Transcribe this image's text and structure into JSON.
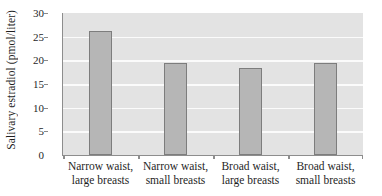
{
  "chart_data": {
    "type": "bar",
    "title": "",
    "xlabel": "",
    "ylabel": "Salivary estradiol (pmol/liter)",
    "categories": [
      "Narrow waist, large breasts",
      "Narrow waist, small breasts",
      "Broad waist, large breasts",
      "Broad waist, small breasts"
    ],
    "category_lines": [
      [
        "Narrow waist,",
        "large breasts"
      ],
      [
        "Narrow waist,",
        "small breasts"
      ],
      [
        "Broad waist,",
        "large breasts"
      ],
      [
        "Broad waist,",
        "small breasts"
      ]
    ],
    "values": [
      26.2,
      19.5,
      18.4,
      19.4
    ],
    "ylim": [
      0,
      30
    ],
    "ytick_values": [
      0,
      5,
      10,
      15,
      20,
      25,
      30
    ],
    "ytick_labels": [
      "0",
      "5",
      "10",
      "15",
      "20",
      "25",
      "30"
    ],
    "grid": "horizontal",
    "legend": "none",
    "colors": {
      "bar_fill": "#b6b6b6",
      "bar_border": "#7d7d7d",
      "plot_background": "#e3e3e3",
      "gridline": "#fbfbfb",
      "axis": "#8d8d8d",
      "text": "#1f1f1f",
      "figure_background": "#ffffff"
    }
  }
}
